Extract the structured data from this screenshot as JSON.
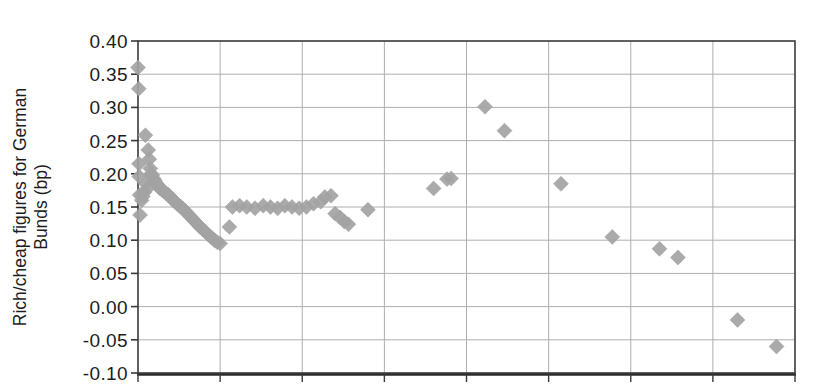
{
  "chart_data": {
    "type": "scatter",
    "title": "",
    "subtitle": "",
    "xlabel": "",
    "ylabel": "Rich/cheap figures for German Bunds (bp)",
    "ylabel_line1": "Rich/cheap figures for German",
    "ylabel_line2": "Bunds (bp)",
    "ytick_labels": [
      "0.40",
      "0.35",
      "0.30",
      "0.25",
      "0.20",
      "0.15",
      "0.10",
      "0.05",
      "0.00",
      "-0.05",
      "-0.10"
    ],
    "ytick_values": [
      0.4,
      0.35,
      0.3,
      0.25,
      0.2,
      0.15,
      0.1,
      0.05,
      0.0,
      -0.05,
      -0.1
    ],
    "ylim": [
      -0.1,
      0.4
    ],
    "xlim": [
      0,
      32
    ],
    "xtick_labels": [],
    "xtick_values": [
      0,
      4,
      8,
      12,
      16,
      20,
      24,
      28,
      32
    ],
    "grid": true,
    "grid_horizontal": true,
    "grid_vertical": true,
    "legend": false,
    "legend_position": "none",
    "marker": "diamond",
    "marker_color": "#a3a3a3",
    "marker_size": 15,
    "series": [
      {
        "name": "Bund rich/cheap",
        "points": [
          [
            0.0,
            0.36
          ],
          [
            0.04,
            0.328
          ],
          [
            0.05,
            0.215
          ],
          [
            0.06,
            0.196
          ],
          [
            0.08,
            0.168
          ],
          [
            0.1,
            0.138
          ],
          [
            0.36,
            0.258
          ],
          [
            0.5,
            0.236
          ],
          [
            0.55,
            0.222
          ],
          [
            0.6,
            0.208
          ],
          [
            0.64,
            0.2
          ],
          [
            0.7,
            0.198
          ],
          [
            0.76,
            0.193
          ],
          [
            0.82,
            0.19
          ],
          [
            0.88,
            0.186
          ],
          [
            0.94,
            0.184
          ],
          [
            1.0,
            0.18
          ],
          [
            1.08,
            0.178
          ],
          [
            1.16,
            0.176
          ],
          [
            1.24,
            0.174
          ],
          [
            1.32,
            0.172
          ],
          [
            1.4,
            0.17
          ],
          [
            1.48,
            0.168
          ],
          [
            1.56,
            0.166
          ],
          [
            1.64,
            0.163
          ],
          [
            1.72,
            0.16
          ],
          [
            1.8,
            0.158
          ],
          [
            1.9,
            0.155
          ],
          [
            2.0,
            0.152
          ],
          [
            2.1,
            0.15
          ],
          [
            2.2,
            0.147
          ],
          [
            2.3,
            0.144
          ],
          [
            2.42,
            0.14
          ],
          [
            2.54,
            0.136
          ],
          [
            2.66,
            0.132
          ],
          [
            2.78,
            0.128
          ],
          [
            2.9,
            0.124
          ],
          [
            3.02,
            0.12
          ],
          [
            3.16,
            0.116
          ],
          [
            3.3,
            0.112
          ],
          [
            3.44,
            0.108
          ],
          [
            3.58,
            0.104
          ],
          [
            3.72,
            0.1
          ],
          [
            3.86,
            0.097
          ],
          [
            4.0,
            0.095
          ],
          [
            0.38,
            0.185
          ],
          [
            0.46,
            0.178
          ],
          [
            0.3,
            0.172
          ],
          [
            0.24,
            0.166
          ],
          [
            0.18,
            0.16
          ],
          [
            4.45,
            0.12
          ],
          [
            4.6,
            0.15
          ],
          [
            4.95,
            0.152
          ],
          [
            5.3,
            0.15
          ],
          [
            5.7,
            0.148
          ],
          [
            6.1,
            0.152
          ],
          [
            6.45,
            0.15
          ],
          [
            6.8,
            0.148
          ],
          [
            7.15,
            0.152
          ],
          [
            7.5,
            0.15
          ],
          [
            7.85,
            0.148
          ],
          [
            8.2,
            0.15
          ],
          [
            8.55,
            0.155
          ],
          [
            8.9,
            0.158
          ],
          [
            9.1,
            0.165
          ],
          [
            9.4,
            0.167
          ],
          [
            9.6,
            0.14
          ],
          [
            9.85,
            0.134
          ],
          [
            10.05,
            0.128
          ],
          [
            10.25,
            0.124
          ],
          [
            11.2,
            0.146
          ],
          [
            14.4,
            0.178
          ],
          [
            15.05,
            0.192
          ],
          [
            15.25,
            0.193
          ],
          [
            16.9,
            0.301
          ],
          [
            17.85,
            0.265
          ],
          [
            20.6,
            0.185
          ],
          [
            23.1,
            0.105
          ],
          [
            25.4,
            0.087
          ],
          [
            26.3,
            0.074
          ],
          [
            29.2,
            -0.02
          ],
          [
            31.1,
            -0.06
          ]
        ]
      }
    ]
  },
  "figure": {
    "background_color": "#ffffff",
    "axis_color": "#3a3a3a",
    "grid_color": "#aeaeae"
  }
}
